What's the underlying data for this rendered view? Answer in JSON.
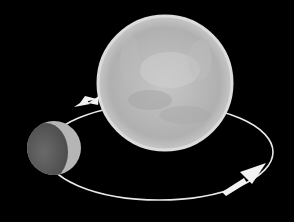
{
  "diagram": {
    "background_color": "#000000",
    "bodies": [
      {
        "name": "primary-body",
        "cx": 165,
        "cy": 83,
        "r": 67,
        "color": "#b8b8b8",
        "rim_color": "#e2e2e2"
      },
      {
        "name": "orbiting-body",
        "cx": 54,
        "cy": 148,
        "r": 27,
        "dark_color": "#5e5e5e",
        "lit_color": "#b5b5b5"
      }
    ],
    "orbit": {
      "cx": 159,
      "cy": 152,
      "rx": 114,
      "ry": 48,
      "color": "#e8e8e8"
    },
    "arrows": [
      {
        "name": "orbit-arrow-upper-left",
        "direction": "left",
        "x": 84,
        "y": 103
      },
      {
        "name": "orbit-arrow-lower-right",
        "direction": "up-right",
        "x": 252,
        "y": 172
      }
    ],
    "labels": []
  }
}
